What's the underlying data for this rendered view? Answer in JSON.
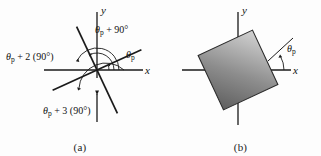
{
  "figure": {
    "background_color": "#fdfdfd",
    "ink_color": "#1a1a1a",
    "panels": [
      {
        "id": "a",
        "caption": "(a)",
        "axis_x_label": "x",
        "axis_y_label": "y",
        "angle_labels": [
          {
            "name": "theta-p",
            "text": "θ",
            "sub": "p",
            "rest": ""
          },
          {
            "name": "theta-p-plus-90",
            "text": "θ",
            "sub": "p",
            "rest": " + 90°"
          },
          {
            "name": "theta-p-plus-2-90",
            "text": "θ",
            "sub": "p",
            "rest": " + 2 (90°)"
          },
          {
            "name": "theta-p-plus-3-90",
            "text": "θ",
            "sub": "p",
            "rest": " + 3 (90°)"
          }
        ],
        "ray_angles_deg": [
          25,
          115,
          205,
          295
        ],
        "arc_count": 4
      },
      {
        "id": "b",
        "caption": "(b)",
        "axis_x_label": "x",
        "axis_y_label": "y",
        "angle_labels": [
          {
            "name": "theta-p",
            "text": "θ",
            "sub": "p",
            "rest": ""
          }
        ],
        "square_rotation_deg": 25,
        "square_fill_dark": "#6e6e6e",
        "square_fill_light": "#c9c9c9"
      }
    ]
  }
}
